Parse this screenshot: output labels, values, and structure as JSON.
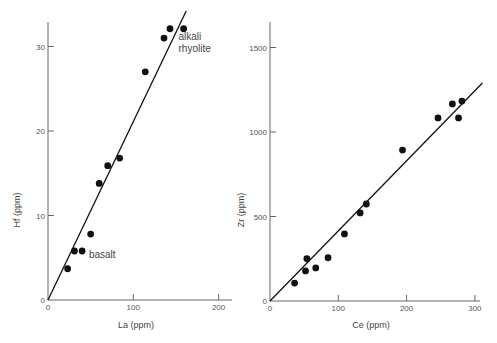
{
  "chart_data": [
    {
      "type": "scatter",
      "title": "",
      "xlabel": "La (ppm)",
      "ylabel": "Hf (ppm)",
      "xlim": [
        0,
        210
      ],
      "ylim": [
        0,
        34
      ],
      "xticks": [
        0,
        100,
        200
      ],
      "yticks": [
        0,
        10,
        20,
        30
      ],
      "grid": false,
      "legend": null,
      "annotations": [
        {
          "text": "basalt",
          "x": 48,
          "y": 5
        },
        {
          "text": "alkali",
          "x": 153,
          "y": 30.8
        },
        {
          "text": "rhyolite",
          "x": 153,
          "y": 29.3
        }
      ],
      "series": [
        {
          "name": "samples",
          "points": [
            {
              "x": 23,
              "y": 3.7
            },
            {
              "x": 31,
              "y": 5.8
            },
            {
              "x": 40,
              "y": 5.8
            },
            {
              "x": 50,
              "y": 7.8
            },
            {
              "x": 60,
              "y": 13.8
            },
            {
              "x": 70,
              "y": 15.9
            },
            {
              "x": 84,
              "y": 16.8
            },
            {
              "x": 114,
              "y": 27.0
            },
            {
              "x": 136,
              "y": 31.0
            },
            {
              "x": 143,
              "y": 32.1
            },
            {
              "x": 159,
              "y": 32.1
            }
          ]
        }
      ],
      "fit_line": {
        "x": [
          0,
          162
        ],
        "y": [
          0,
          34.2
        ]
      }
    },
    {
      "type": "scatter",
      "title": "",
      "xlabel": "Ce (ppm)",
      "ylabel": "Zr (ppm)",
      "xlim": [
        0,
        310
      ],
      "ylim": [
        0,
        1650
      ],
      "xticks": [
        0,
        100,
        200,
        300
      ],
      "yticks": [
        0,
        500,
        1000,
        1500
      ],
      "grid": false,
      "legend": null,
      "annotations": [],
      "series": [
        {
          "name": "samples",
          "points": [
            {
              "x": 36,
              "y": 106
            },
            {
              "x": 52,
              "y": 178
            },
            {
              "x": 54,
              "y": 250
            },
            {
              "x": 67,
              "y": 196
            },
            {
              "x": 85,
              "y": 256
            },
            {
              "x": 109,
              "y": 397
            },
            {
              "x": 132,
              "y": 521
            },
            {
              "x": 141,
              "y": 574
            },
            {
              "x": 194,
              "y": 893
            },
            {
              "x": 246,
              "y": 1083
            },
            {
              "x": 267,
              "y": 1166
            },
            {
              "x": 276,
              "y": 1083
            },
            {
              "x": 281,
              "y": 1183
            }
          ]
        }
      ],
      "fit_line": {
        "x": [
          0,
          311
        ],
        "y": [
          0,
          1290
        ]
      }
    }
  ]
}
